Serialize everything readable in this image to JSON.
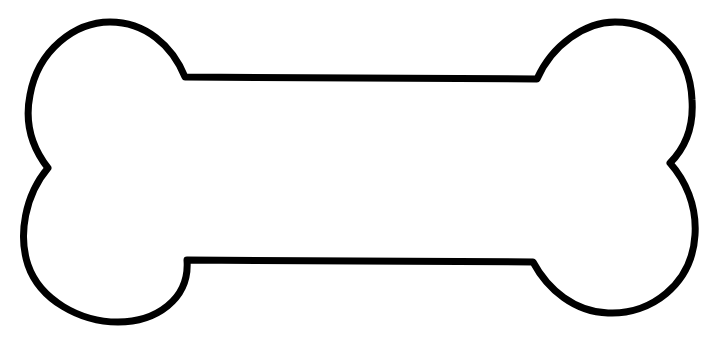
{
  "image": {
    "subject": "bone outline",
    "stroke_color": "#000000",
    "fill_color": "#ffffff",
    "background_color": "#ffffff",
    "stroke_width": 7
  }
}
